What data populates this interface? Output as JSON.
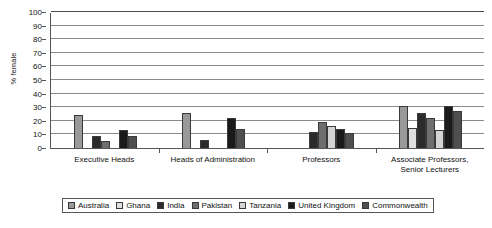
{
  "chart_data": {
    "type": "bar",
    "title": "",
    "xlabel": "",
    "ylabel": "% female",
    "ylim": [
      0,
      100
    ],
    "yticks": [
      0,
      10,
      20,
      30,
      40,
      50,
      60,
      70,
      80,
      90,
      100
    ],
    "grid": true,
    "legend_position": "bottom",
    "categories": [
      "Executive Heads",
      "Heads of Administration",
      "Professors",
      "Associate Professors, Senior Lecturers"
    ],
    "category_lines": [
      [
        "Executive Heads"
      ],
      [
        "Heads of Administration"
      ],
      [
        "Professors"
      ],
      [
        "Associate Professors,",
        "Senior Lecturers"
      ]
    ],
    "series": [
      {
        "name": "Australia",
        "color": "#999999",
        "values": [
          24,
          26,
          0,
          31
        ]
      },
      {
        "name": "Ghana",
        "color": "#e0e0e0",
        "values": [
          0,
          0,
          0,
          15
        ]
      },
      {
        "name": "India",
        "color": "#2b2b2b",
        "values": [
          9,
          6,
          12,
          26
        ]
      },
      {
        "name": "Pakistan",
        "color": "#6e6e6e",
        "values": [
          5,
          0,
          19,
          22
        ]
      },
      {
        "name": "Tanzania",
        "color": "#d4d4d4",
        "values": [
          0,
          0,
          16,
          13
        ]
      },
      {
        "name": "United Kingdom",
        "color": "#1a1a1a",
        "values": [
          13,
          22,
          14,
          31
        ]
      },
      {
        "name": "Commonwealth",
        "color": "#4f4f4f",
        "values": [
          9,
          14,
          11,
          27
        ]
      }
    ]
  },
  "legend": {
    "items": [
      {
        "label": "Australia"
      },
      {
        "label": "Ghana"
      },
      {
        "label": "India"
      },
      {
        "label": "Pakistan"
      },
      {
        "label": "Tanzania"
      },
      {
        "label": "United Kingdom"
      },
      {
        "label": "Commonwealth"
      }
    ]
  }
}
